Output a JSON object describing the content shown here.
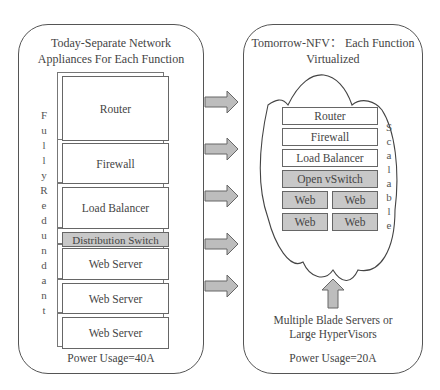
{
  "left": {
    "title_line1": "Today-Separate Network",
    "title_line2": "Appliances For Each Function",
    "side_label": "Fully Redundant",
    "boxes": [
      "Router",
      "Firewall",
      "Load Balancer",
      "Distribution Switch",
      "Web Server",
      "Web Server",
      "Web Server"
    ],
    "power": "Power Usage=40A"
  },
  "right": {
    "title_line1": "Tomorrow-NFV： Each Function",
    "title_line2": "Virtualized",
    "boxes": [
      "Router",
      "Firewall",
      "Load Balancer",
      "Open vSwitch"
    ],
    "web": [
      "Web",
      "Web",
      "Web",
      "Web"
    ],
    "side_label": "Scalable",
    "hardware_line1": "Multiple Blade Servers or",
    "hardware_line2": "Large HyperVisors",
    "power": "Power Usage=20A"
  },
  "colors": {
    "appliance_fill": "#ffffff",
    "switch_fill": "#c8c8c8",
    "arrow_fill": "#bdbdbd",
    "border": "#555555"
  }
}
